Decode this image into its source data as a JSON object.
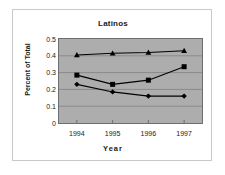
{
  "chart_data": {
    "type": "line",
    "title": "Latinos",
    "xlabel": "Year",
    "ylabel": "Percent of Total",
    "categories": [
      "1994",
      "1995",
      "1996",
      "1997"
    ],
    "x": [
      1994,
      1995,
      1996,
      1997
    ],
    "ylim": [
      0,
      0.5
    ],
    "ytick_labels": [
      "0.5",
      "0.4",
      "0.3",
      "0.2",
      "0.1",
      "0"
    ],
    "ytick_values": [
      0.5,
      0.4,
      0.3,
      0.2,
      0.1,
      0
    ],
    "grid": true,
    "grid_axis": "y",
    "legend": "none",
    "plot_background": "#adadad",
    "series_color": "#000000",
    "series": [
      {
        "name": "series-triangle",
        "marker": "triangle",
        "values": [
          0.405,
          0.415,
          0.42,
          0.43
        ]
      },
      {
        "name": "series-square",
        "marker": "square",
        "values": [
          0.285,
          0.23,
          0.255,
          0.335
        ]
      },
      {
        "name": "series-diamond",
        "marker": "diamond",
        "values": [
          0.23,
          0.185,
          0.16,
          0.16
        ]
      }
    ]
  }
}
